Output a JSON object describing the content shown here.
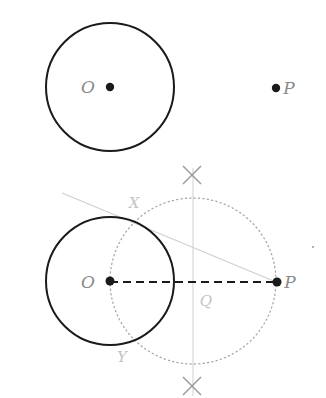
{
  "colors": {
    "ink": "#1a1a1a",
    "label": "#8a8a8a",
    "faint_label": "#c4c4c4",
    "construction": "#cfcfcf",
    "dotted_circle": "#a8a8a8",
    "cross": "#999999"
  },
  "top_figure": {
    "circle": {
      "cx": 110,
      "cy": 87,
      "r": 64
    },
    "points": [
      {
        "name": "O",
        "x": 110,
        "y": 87,
        "label": "O",
        "label_x": 88,
        "label_y": 93
      },
      {
        "name": "P",
        "x": 276,
        "y": 88,
        "label": "P",
        "label_x": 289,
        "label_y": 94
      }
    ]
  },
  "bottom_figure": {
    "circle": {
      "cx": 110,
      "cy": 281,
      "r": 64
    },
    "dotted_circle": {
      "cx": 193,
      "cy": 281,
      "r": 83
    },
    "segment_OP": {
      "x1": 110,
      "y1": 282,
      "x2": 276,
      "y2": 282,
      "style": "dashed"
    },
    "perpendicular_bisector": {
      "x": 193,
      "y1": 168,
      "y2": 396
    },
    "tangent_line": {
      "x1": 62,
      "y1": 193,
      "x2": 276,
      "y2": 282
    },
    "arc_marks": [
      {
        "cx": 192,
        "cy": 175,
        "size": 9
      },
      {
        "cx": 192,
        "cy": 386,
        "size": 9
      }
    ],
    "points": [
      {
        "name": "O",
        "x": 110,
        "y": 281,
        "label": "O",
        "label_x": 88,
        "label_y": 288
      },
      {
        "name": "P",
        "x": 277,
        "y": 282,
        "label": "P",
        "label_x": 290,
        "label_y": 288
      }
    ],
    "labels": {
      "X": {
        "text": "X",
        "x": 134,
        "y": 208
      },
      "Y": {
        "text": "Y",
        "x": 122,
        "y": 362
      },
      "Q": {
        "text": "Q",
        "x": 206,
        "y": 306
      }
    },
    "stray_dot": {
      "x": 313,
      "y": 247
    }
  }
}
